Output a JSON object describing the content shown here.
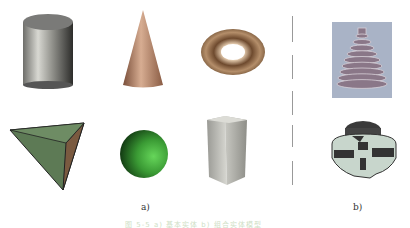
{
  "figure": {
    "panels": [
      {
        "id": "a",
        "label": "a)",
        "shapes": [
          {
            "name": "cylinder",
            "color": "#8a8a86"
          },
          {
            "name": "cone",
            "color": "#b88a6c"
          },
          {
            "name": "torus",
            "color": "#8a6a50"
          },
          {
            "name": "tetrahedron",
            "color": "#5d7a55"
          },
          {
            "name": "sphere",
            "color": "#3f9e3a"
          },
          {
            "name": "rectangular-prism",
            "color": "#b5b5b0"
          }
        ]
      },
      {
        "id": "b",
        "label": "b)",
        "shapes": [
          {
            "name": "stepped-cone-model",
            "color": "#a0a8b8"
          },
          {
            "name": "cutaway-coupling-model",
            "color": "#444444"
          }
        ]
      }
    ],
    "caption": "图 5-5   a) 基本实体  b) 组合实体模型"
  }
}
